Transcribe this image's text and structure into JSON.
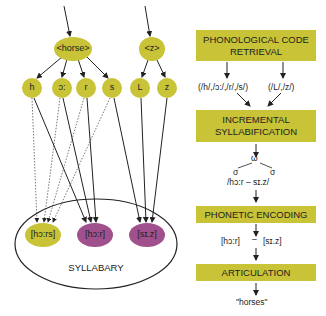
{
  "colors": {
    "node_yellow": "#c8c337",
    "node_purple": "#a0508c",
    "box_yellow": "#c8c337",
    "line": "#222222"
  },
  "left": {
    "words": [
      {
        "label": "<horse>",
        "cx": 73,
        "cy": 49
      },
      {
        "label": "<z>",
        "cx": 152,
        "cy": 49
      }
    ],
    "segments": [
      {
        "label": "h",
        "cx": 32,
        "cy": 88
      },
      {
        "label": "ɔ:",
        "cx": 62,
        "cy": 88
      },
      {
        "label": "r",
        "cx": 86,
        "cy": 88
      },
      {
        "label": "s",
        "cx": 112,
        "cy": 88
      },
      {
        "label": "L",
        "cx": 140,
        "cy": 88
      },
      {
        "label": "z",
        "cx": 167,
        "cy": 88
      }
    ],
    "syllables": [
      {
        "label": "[hɔ:rs]",
        "cx": 43,
        "cy": 235,
        "color": "#c8c337"
      },
      {
        "label": "[hɔ:r]",
        "cx": 95,
        "cy": 235,
        "color": "#a0508c"
      },
      {
        "label": "[sɪ.z]",
        "cx": 147,
        "cy": 235,
        "color": "#a0508c"
      }
    ],
    "syllabary_label": "SYLLABARY"
  },
  "right": {
    "stage1": "PHONOLOGICAL CODE RETRIEVAL",
    "code1": "(/h/,/ɔ:/,/r/,/s/)",
    "code2": "(/L/,/z/)",
    "stage2": "INCREMENTAL SYLLABIFICATION",
    "omega": "ω",
    "sigma": "σ",
    "syllabified": "/hɔ:r – sɪ.z/",
    "stage3": "PHONETIC ENCODING",
    "phonetic1": "[hɔ:r]",
    "phonetic_sep": "–",
    "phonetic2": "[sɪ.z]",
    "stage4": "ARTICULATION",
    "output": "\"horses\""
  }
}
